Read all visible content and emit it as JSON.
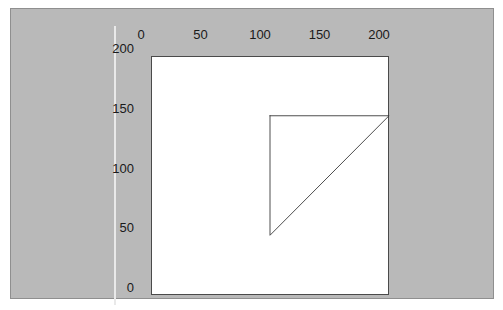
{
  "figure": {
    "background_color": "#b9b9b9",
    "panel_border_color": "#8f8f8f",
    "plot_background_color": "#ffffff",
    "plot_border_color": "#4a4a4a",
    "shape_stroke_color": "#3a3a3a",
    "guide_line_color": "#e9e9e9"
  },
  "chart_data": {
    "type": "line",
    "title": "",
    "xlabel": "",
    "ylabel": "",
    "xlim": [
      0,
      200
    ],
    "ylim": [
      200,
      0
    ],
    "x_axis_position": "top",
    "y_axis_position": "left",
    "y_axis_inverted": true,
    "grid": false,
    "legend": "none",
    "x_ticks": [
      0,
      50,
      100,
      150,
      200
    ],
    "x_tick_labels": [
      "0",
      "50",
      "100",
      "150",
      "200"
    ],
    "y_ticks": [
      0,
      50,
      100,
      150,
      200
    ],
    "y_tick_labels": [
      "0",
      "50",
      "100",
      "150",
      "200"
    ],
    "series": [
      {
        "name": "triangle",
        "type": "closed-polygon",
        "fill": "none",
        "stroke": "#3a3a3a",
        "stroke_width": 1,
        "points": [
          {
            "x": 100,
            "y": 50
          },
          {
            "x": 200,
            "y": 50
          },
          {
            "x": 100,
            "y": 150
          },
          {
            "x": 100,
            "y": 50
          }
        ]
      }
    ],
    "annotations": []
  }
}
